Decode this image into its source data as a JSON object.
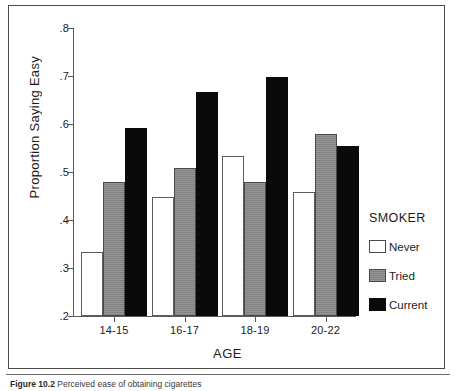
{
  "chart_data": {
    "type": "bar",
    "title": "",
    "xlabel": "AGE",
    "ylabel": "Proportion Saying Easy",
    "categories": [
      "14-15",
      "16-17",
      "18-19",
      "20-22"
    ],
    "series": [
      {
        "name": "Never",
        "color": "#ffffff",
        "values": [
          0.333,
          0.447,
          0.533,
          0.459
        ]
      },
      {
        "name": "Tried",
        "color": "#8a8a8a",
        "values": [
          0.479,
          0.508,
          0.48,
          0.58
        ]
      },
      {
        "name": "Current",
        "color": "#0a0a0a",
        "values": [
          0.591,
          0.666,
          0.697,
          0.555
        ]
      }
    ],
    "ylim": [
      0.2,
      0.8
    ],
    "yticks": [
      ".8",
      ".7",
      ".6",
      ".5",
      ".4",
      ".3",
      ".2"
    ],
    "ytick_values": [
      0.8,
      0.7,
      0.6,
      0.5,
      0.4,
      0.3,
      0.2
    ],
    "grid": false,
    "legend_position": "right",
    "legend_title": "SMOKER"
  },
  "legend": {
    "title": "SMOKER",
    "items": [
      {
        "label": "Never",
        "swatch": "never"
      },
      {
        "label": "Tried",
        "swatch": "tried"
      },
      {
        "label": "Current",
        "swatch": "current"
      }
    ]
  },
  "axes": {
    "y_title": "Proportion Saying Easy",
    "x_title": "AGE"
  },
  "caption": {
    "number": "Figure 10.2",
    "text": "Perceived ease of obtaining cigarettes"
  }
}
